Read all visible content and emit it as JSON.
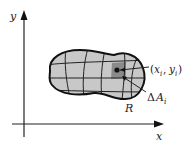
{
  "diagram": {
    "axes": {
      "x_label": "x",
      "y_label": "y"
    },
    "region": {
      "label": "R",
      "fill_color": "#c8c8c8",
      "highlight_color": "#8a8a8a",
      "outline_color": "#111111"
    },
    "point_label": {
      "open": "(",
      "x": "x",
      "x_sub": "i",
      "comma": ", ",
      "y": "y",
      "y_sub": "i",
      "close": ")"
    },
    "area_label": {
      "delta": "Δ",
      "a": "A",
      "sub": "i"
    }
  }
}
